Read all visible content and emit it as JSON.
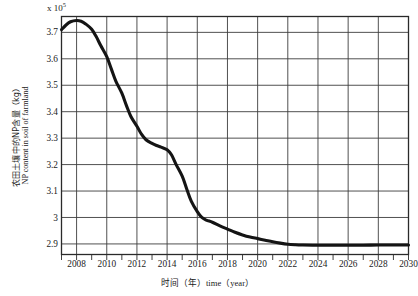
{
  "figure": {
    "exponent_label": "x 10",
    "exponent_sup": "5",
    "y_axis_title_cn": "农田土壤中的NP含量（kg）",
    "y_axis_title_en": "NP content in soil of farmland",
    "x_axis_title_cn": "时间（年）",
    "x_axis_title_en": "time（year）",
    "line_color": "#141414",
    "grid_color": "#3d3d3d",
    "axis_color": "#2a2a2a",
    "background_color": "#ffffff"
  },
  "chart_data": {
    "type": "line",
    "title": "",
    "xlabel": "时间（年）time（year）",
    "ylabel": "农田土壤中的NP含量（kg） NP content in soil of farmland",
    "y_scale_multiplier": "1e5",
    "xlim": [
      2007,
      2030
    ],
    "ylim": [
      2.86,
      3.76
    ],
    "grid": true,
    "legend": null,
    "xticks": [
      2008,
      2010,
      2012,
      2014,
      2016,
      2018,
      2020,
      2022,
      2024,
      2026,
      2028,
      2030
    ],
    "xtick_labels": [
      "2008",
      "2010",
      "2012",
      "2014",
      "2016",
      "2018",
      "2020",
      "2022",
      "2024",
      "2026",
      "2028",
      "2030"
    ],
    "yticks": [
      2.9,
      3.0,
      3.1,
      3.2,
      3.3,
      3.4,
      3.5,
      3.6,
      3.7
    ],
    "ytick_labels": [
      "2.9",
      "3",
      "3.1",
      "3.2",
      "3.3",
      "3.4",
      "3.5",
      "3.6",
      "3.7"
    ],
    "series": [
      {
        "name": "NP content in soil of farmland",
        "x": [
          2007.0,
          2007.3,
          2007.6,
          2008.0,
          2008.3,
          2008.6,
          2009.0,
          2009.3,
          2009.6,
          2010.0,
          2010.3,
          2010.6,
          2011.0,
          2011.3,
          2011.6,
          2012.0,
          2012.3,
          2012.6,
          2013.0,
          2013.3,
          2013.6,
          2014.0,
          2014.3,
          2014.6,
          2015.0,
          2015.3,
          2015.6,
          2016.0,
          2016.3,
          2016.6,
          2017.0,
          2017.5,
          2018.0,
          2018.5,
          2019.0,
          2019.5,
          2020.0,
          2020.5,
          2021.0,
          2021.5,
          2022.0,
          2022.5,
          2023.0,
          2024.0,
          2025.0,
          2026.0,
          2027.0,
          2028.0,
          2029.0,
          2030.0
        ],
        "y": [
          3.71,
          3.728,
          3.74,
          3.745,
          3.742,
          3.732,
          3.712,
          3.684,
          3.65,
          3.608,
          3.562,
          3.516,
          3.47,
          3.424,
          3.382,
          3.345,
          3.315,
          3.294,
          3.28,
          3.272,
          3.266,
          3.256,
          3.236,
          3.2,
          3.156,
          3.108,
          3.062,
          3.022,
          3.0,
          2.99,
          2.982,
          2.968,
          2.956,
          2.944,
          2.934,
          2.926,
          2.92,
          2.914,
          2.908,
          2.903,
          2.899,
          2.897,
          2.896,
          2.895,
          2.895,
          2.895,
          2.895,
          2.896,
          2.896,
          2.896
        ]
      }
    ]
  }
}
